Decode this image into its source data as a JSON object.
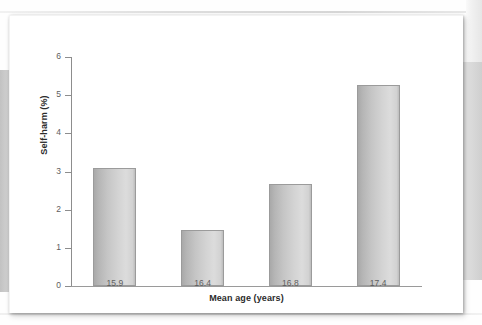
{
  "figure": {
    "background_color": "#ffffff",
    "bar_fill_light": "#dcdcdc",
    "bar_fill_dark": "#a9a9a9",
    "bar_border_color": "#9b9b9b",
    "axis_color": "#8d8d8d"
  },
  "chart_data": {
    "type": "bar",
    "title": "",
    "xlabel": "Mean age (years)",
    "ylabel": "Self-harm (%)",
    "categories": [
      "15.9",
      "16.4",
      "16.8",
      "17.4"
    ],
    "values": [
      3.1,
      1.48,
      2.67,
      5.27
    ],
    "ylim": [
      0,
      6
    ],
    "yticks": [
      "0",
      "1",
      "2",
      "3",
      "4",
      "5",
      "6"
    ],
    "ytick_values": [
      0,
      1,
      2,
      3,
      4,
      5,
      6
    ],
    "grid": false,
    "legend": null,
    "legend_position": "none",
    "series": [
      {
        "name": "Self-harm (%)",
        "values": [
          3.1,
          1.48,
          2.67,
          5.27
        ]
      }
    ],
    "annotations": []
  }
}
